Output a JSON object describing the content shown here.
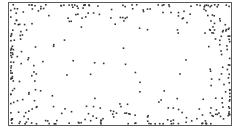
{
  "diagram": {
    "type": "scatter-field",
    "frame": {
      "x": 8,
      "y": 2,
      "width": 224,
      "height": 124,
      "color": "#5a5a5a"
    },
    "dot_color": "#333333",
    "dot_size": 1.6
  }
}
